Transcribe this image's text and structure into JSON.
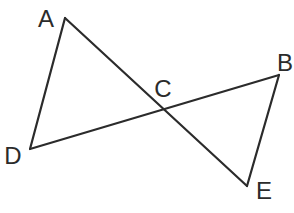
{
  "diagram": {
    "title": "",
    "stroke_color": "#2b2b2b",
    "points": {
      "A": {
        "label": "A",
        "x": 65,
        "y": 18,
        "label_x": 46,
        "label_y": 27
      },
      "B": {
        "label": "B",
        "x": 279,
        "y": 75,
        "label_x": 285,
        "label_y": 71
      },
      "C": {
        "label": "C",
        "x": 163,
        "y": 110,
        "label_x": 163,
        "label_y": 97
      },
      "D": {
        "label": "D",
        "x": 30,
        "y": 149,
        "label_x": 13,
        "label_y": 164
      },
      "E": {
        "label": "E",
        "x": 247,
        "y": 186,
        "label_x": 264,
        "label_y": 199
      }
    },
    "segments": [
      {
        "from": "A",
        "to": "D"
      },
      {
        "from": "A",
        "to": "E"
      },
      {
        "from": "D",
        "to": "B"
      },
      {
        "from": "B",
        "to": "E"
      }
    ]
  }
}
